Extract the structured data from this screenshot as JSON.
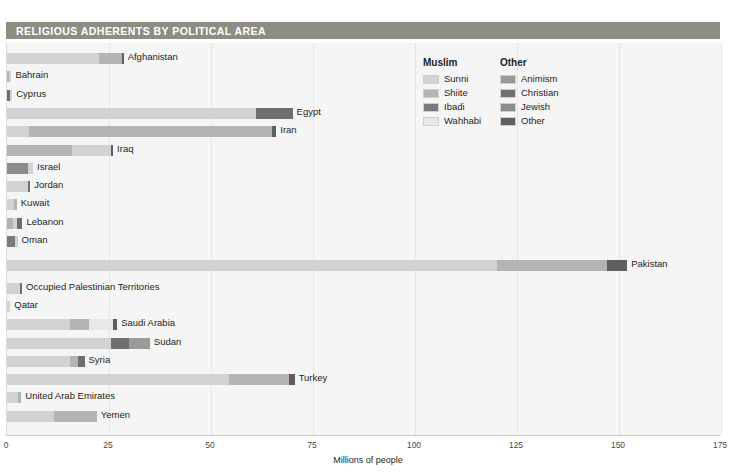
{
  "header": {
    "title": "RELIGIOUS ADHERENTS BY POLITICAL AREA"
  },
  "legend": {
    "groups": [
      {
        "name": "Muslim",
        "items": [
          {
            "label": "Sunni",
            "color": "#d2d2d2"
          },
          {
            "label": "Shiite",
            "color": "#b4b4b4"
          },
          {
            "label": "Ibadi",
            "color": "#7b7b7b"
          },
          {
            "label": "Wahhabi",
            "color": "#e8e8e8"
          }
        ]
      },
      {
        "name": "Other",
        "items": [
          {
            "label": "Animism",
            "color": "#9a9a9a"
          },
          {
            "label": "Christian",
            "color": "#6f6f6f"
          },
          {
            "label": "Jewish",
            "color": "#8c8c8c"
          },
          {
            "label": "Other",
            "color": "#5f5f5f"
          }
        ]
      }
    ]
  },
  "chart_data": {
    "type": "bar",
    "orientation": "horizontal",
    "stacked": true,
    "title": "RELIGIOUS ADHERENTS BY POLITICAL AREA",
    "xlabel": "Millions of people",
    "ylabel": "",
    "xlim": [
      0,
      175
    ],
    "xticks": [
      0,
      25,
      50,
      75,
      100,
      125,
      150,
      175
    ],
    "grid": true,
    "legend_position": "top-right",
    "series": [
      {
        "name": "Sunni",
        "color": "#d2d2d2"
      },
      {
        "name": "Shiite",
        "color": "#b4b4b4"
      },
      {
        "name": "Ibadi",
        "color": "#7b7b7b"
      },
      {
        "name": "Wahhabi",
        "color": "#e8e8e8"
      },
      {
        "name": "Animism",
        "color": "#9a9a9a"
      },
      {
        "name": "Christian",
        "color": "#6f6f6f"
      },
      {
        "name": "Jewish",
        "color": "#8c8c8c"
      },
      {
        "name": "Other",
        "color": "#5f5f5f"
      }
    ],
    "categories": [
      "Afghanistan",
      "Bahrain",
      "Cyprus",
      "Egypt",
      "Iran",
      "Iraq",
      "Israel",
      "Jordan",
      "Kuwait",
      "Lebanon",
      "Oman",
      "Pakistan",
      "Occupied Palestinian Territories",
      "Qatar",
      "Saudi Arabia",
      "Sudan",
      "Syria",
      "Turkey",
      "United Arab Emirates",
      "Yemen"
    ],
    "bars": [
      {
        "category": "Afghanistan",
        "total": 28.4,
        "segments": [
          {
            "series": "Sunni",
            "value": 22.6
          },
          {
            "series": "Shiite",
            "value": 5.5
          },
          {
            "series": "Other",
            "value": 0.3
          }
        ]
      },
      {
        "category": "Bahrain",
        "total": 1.0,
        "segments": [
          {
            "series": "Shiite",
            "value": 0.6
          },
          {
            "series": "Sunni",
            "value": 0.4
          }
        ]
      },
      {
        "category": "Cyprus",
        "total": 1.1,
        "segments": [
          {
            "series": "Christian",
            "value": 0.8
          },
          {
            "series": "Sunni",
            "value": 0.3
          }
        ]
      },
      {
        "category": "Egypt",
        "total": 70.0,
        "segments": [
          {
            "series": "Sunni",
            "value": 61.0
          },
          {
            "series": "Christian",
            "value": 9.0
          }
        ]
      },
      {
        "category": "Iran",
        "total": 66.0,
        "segments": [
          {
            "series": "Sunni",
            "value": 5.5
          },
          {
            "series": "Shiite",
            "value": 59.5
          },
          {
            "series": "Other",
            "value": 1.0
          }
        ]
      },
      {
        "category": "Iraq",
        "total": 26.0,
        "segments": [
          {
            "series": "Shiite",
            "value": 16.0
          },
          {
            "series": "Sunni",
            "value": 9.4
          },
          {
            "series": "Other",
            "value": 0.6
          }
        ]
      },
      {
        "category": "Israel",
        "total": 6.4,
        "segments": [
          {
            "series": "Jewish",
            "value": 5.2
          },
          {
            "series": "Sunni",
            "value": 1.2
          }
        ]
      },
      {
        "category": "Jordan",
        "total": 5.5,
        "segments": [
          {
            "series": "Sunni",
            "value": 5.2
          },
          {
            "series": "Christian",
            "value": 0.3
          }
        ]
      },
      {
        "category": "Kuwait",
        "total": 2.4,
        "segments": [
          {
            "series": "Sunni",
            "value": 1.7
          },
          {
            "series": "Shiite",
            "value": 0.7
          }
        ]
      },
      {
        "category": "Lebanon",
        "total": 3.8,
        "segments": [
          {
            "series": "Shiite",
            "value": 1.4
          },
          {
            "series": "Sunni",
            "value": 1.1
          },
          {
            "series": "Christian",
            "value": 1.3
          }
        ]
      },
      {
        "category": "Oman",
        "total": 2.6,
        "segments": [
          {
            "series": "Ibadi",
            "value": 2.0
          },
          {
            "series": "Sunni",
            "value": 0.6
          }
        ]
      },
      {
        "category": "Pakistan",
        "total": 152.0,
        "segments": [
          {
            "series": "Sunni",
            "value": 120.0
          },
          {
            "series": "Shiite",
            "value": 27.0
          },
          {
            "series": "Other",
            "value": 5.0
          }
        ]
      },
      {
        "category": "Occupied Palestinian Territories",
        "total": 3.5,
        "segments": [
          {
            "series": "Sunni",
            "value": 3.2
          },
          {
            "series": "Christian",
            "value": 0.3
          }
        ]
      },
      {
        "category": "Qatar",
        "total": 0.8,
        "segments": [
          {
            "series": "Sunni",
            "value": 0.8
          }
        ]
      },
      {
        "category": "Saudi Arabia",
        "total": 27.0,
        "segments": [
          {
            "series": "Sunni",
            "value": 15.5
          },
          {
            "series": "Shiite",
            "value": 4.5
          },
          {
            "series": "Wahhabi",
            "value": 6.0
          },
          {
            "series": "Other",
            "value": 1.0
          }
        ]
      },
      {
        "category": "Sudan",
        "total": 35.0,
        "segments": [
          {
            "series": "Sunni",
            "value": 25.5
          },
          {
            "series": "Christian",
            "value": 4.5
          },
          {
            "series": "Animism",
            "value": 5.0
          }
        ]
      },
      {
        "category": "Syria",
        "total": 19.0,
        "segments": [
          {
            "series": "Sunni",
            "value": 15.5
          },
          {
            "series": "Shiite",
            "value": 2.0
          },
          {
            "series": "Christian",
            "value": 1.5
          }
        ]
      },
      {
        "category": "Turkey",
        "total": 70.5,
        "segments": [
          {
            "series": "Sunni",
            "value": 54.5
          },
          {
            "series": "Shiite",
            "value": 14.5
          },
          {
            "series": "Other",
            "value": 1.5
          }
        ]
      },
      {
        "category": "United Arab Emirates",
        "total": 3.5,
        "segments": [
          {
            "series": "Sunni",
            "value": 2.7
          },
          {
            "series": "Shiite",
            "value": 0.8
          }
        ]
      },
      {
        "category": "Yemen",
        "total": 22.0,
        "segments": [
          {
            "series": "Sunni",
            "value": 11.5
          },
          {
            "series": "Shiite",
            "value": 10.5
          }
        ]
      }
    ]
  }
}
